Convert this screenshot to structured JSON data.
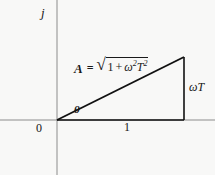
{
  "figure": {
    "background_color": "#f8f8f7",
    "line_color": "#111111",
    "axis_color": "#8c8c8c"
  },
  "axes": {
    "imaginary_axis_label": "j",
    "origin_label": "0",
    "real_axis_tick_label": "1"
  },
  "triangle": {
    "angle_label": "θ",
    "opposite_side_label": "ωT",
    "adjacent_side_label": "1",
    "hypotenuse_label": "A"
  },
  "formula": {
    "magnitude_symbol": "A",
    "equals": "=",
    "radical_sign": "√",
    "term_one": "1",
    "operator": "+",
    "omega": "ω",
    "omega_exponent": "2",
    "tee": "T",
    "tee_exponent": "2",
    "plain_text": "A = √(1 + ω²T²)"
  },
  "geometry": {
    "origin": [
      57,
      120
    ],
    "base_end": [
      184,
      120
    ],
    "apex": [
      184,
      57
    ],
    "vertical_axis_x": 57,
    "horizontal_axis_y": 120
  }
}
